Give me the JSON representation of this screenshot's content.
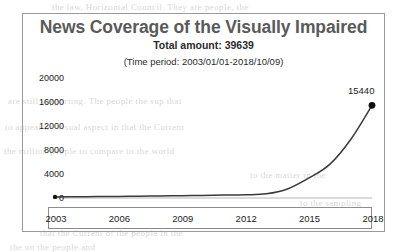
{
  "chart_data": {
    "type": "line",
    "title": "News Coverage of the Visually Impaired",
    "subtitle": "Total amount:  39639",
    "annotation": "(Time period:  2003/01/01-2018/10/09)",
    "xlabel": "",
    "ylabel": "",
    "xlim": [
      2003,
      2018
    ],
    "ylim": [
      0,
      20000
    ],
    "grid": false,
    "legend": null,
    "y_ticks": [
      20000,
      16000,
      12000,
      8000,
      4000,
      0
    ],
    "y_tick_labels": [
      "20000",
      "16000",
      "12000",
      "8000",
      "4000",
      "0"
    ],
    "x_ticks": [
      2003,
      2006,
      2009,
      2012,
      2015,
      2018
    ],
    "x_tick_labels": [
      "2003",
      "2006",
      "2009",
      "2012",
      "2015",
      "2018"
    ],
    "series": [
      {
        "name": "News coverage count",
        "line_color": "#3a3a3a",
        "marker_color": "#111111",
        "x": [
          2003,
          2004,
          2005,
          2006,
          2007,
          2008,
          2009,
          2010,
          2011,
          2012,
          2013,
          2014,
          2015,
          2016,
          2017,
          2018
        ],
        "values": [
          180,
          200,
          230,
          260,
          300,
          340,
          380,
          430,
          480,
          540,
          700,
          1500,
          3300,
          5600,
          9800,
          15440
        ]
      }
    ],
    "point_labels": [
      {
        "x": 2018,
        "y": 15440,
        "text": "15440"
      }
    ],
    "markers": [
      {
        "x": 2003,
        "y": 180
      },
      {
        "x": 2018,
        "y": 15440
      }
    ],
    "total_amount": 39639,
    "max_value": 15440
  },
  "ghost_text": [
    {
      "text": "the law, Horizontal Council. They are people, the",
      "x": 52,
      "y": 2
    },
    {
      "text": "are still supporting. The people the sup that",
      "x": 8,
      "y": 96
    },
    {
      "text": "to  appear  by  visual  aspect  in  that  the  Current",
      "x": 5,
      "y": 122
    },
    {
      "text": "the  million  people  to  compare  to  the  world",
      "x": 4,
      "y": 146
    },
    {
      "text": "to  the  matter  in  the",
      "x": 250,
      "y": 170
    },
    {
      "text": "to  the  sampling",
      "x": 300,
      "y": 198
    },
    {
      "text": "that  the  Current  of  the  people  in  the",
      "x": 40,
      "y": 228
    },
    {
      "text": "the  on  the  people  and",
      "x": 10,
      "y": 242
    }
  ]
}
